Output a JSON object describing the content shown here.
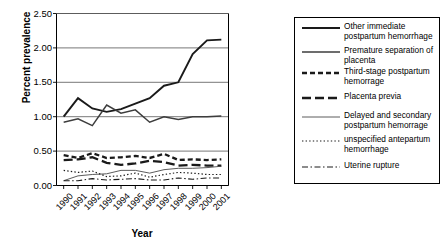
{
  "chart_data": {
    "type": "line",
    "title": "",
    "xlabel": "Year",
    "ylabel": "Percent prevalence",
    "ylim": [
      0.0,
      2.5
    ],
    "yticks": [
      "0.00",
      "0.50",
      "1.00",
      "1.50",
      "2.00",
      "2.50"
    ],
    "grid": true,
    "legend_position": "right",
    "categories": [
      "1990",
      "1991",
      "1992",
      "1993",
      "1994",
      "1995",
      "1996",
      "1997",
      "1998",
      "1999",
      "2000",
      "2001"
    ],
    "series": [
      {
        "name": "Other immediate postpartum hemorrhage",
        "style": "solid-thick",
        "color": "#1a1a1a",
        "values": [
          1.0,
          1.27,
          1.12,
          1.07,
          1.11,
          1.19,
          1.27,
          1.45,
          1.5,
          1.91,
          2.11,
          2.12
        ]
      },
      {
        "name": "Premature separation of placenta",
        "style": "solid-medium",
        "color": "#3d3d3d",
        "values": [
          0.92,
          0.97,
          0.87,
          1.17,
          1.05,
          1.1,
          0.92,
          1.0,
          0.96,
          1.0,
          1.0,
          1.01
        ]
      },
      {
        "name": "Third-stage postpartum hemorrage",
        "style": "dashed-square",
        "color": "#1a1a1a",
        "values": [
          0.44,
          0.4,
          0.47,
          0.4,
          0.41,
          0.43,
          0.4,
          0.46,
          0.37,
          0.38,
          0.37,
          0.38
        ]
      },
      {
        "name": "Placenta previa",
        "style": "dashed-long",
        "color": "#1a1a1a",
        "values": [
          0.37,
          0.38,
          0.41,
          0.33,
          0.3,
          0.32,
          0.36,
          0.34,
          0.29,
          0.3,
          0.29,
          0.29
        ]
      },
      {
        "name": "Delayed and secondary postpartum hemorrage",
        "style": "solid-thin",
        "color": "#4a4a4a",
        "values": [
          0.07,
          0.14,
          0.16,
          0.17,
          0.22,
          0.22,
          0.18,
          0.23,
          0.25,
          0.25,
          0.26,
          0.28
        ]
      },
      {
        "name": "unspecified antepartum hemorrhage",
        "style": "dotted",
        "color": "#1a1a1a",
        "values": [
          0.22,
          0.19,
          0.21,
          0.13,
          0.14,
          0.18,
          0.12,
          0.16,
          0.19,
          0.18,
          0.16,
          0.16
        ]
      },
      {
        "name": "Uterine rupture",
        "style": "dash-dot",
        "color": "#1a1a1a",
        "values": [
          0.07,
          0.07,
          0.1,
          0.08,
          0.09,
          0.1,
          0.08,
          0.08,
          0.11,
          0.09,
          0.11,
          0.11
        ]
      }
    ]
  },
  "legend": {
    "entries": [
      {
        "label": "Other immediate postpartum hemorrhage"
      },
      {
        "label": "Premature separation of placenta"
      },
      {
        "label": "Third-stage postpartum hemorrage"
      },
      {
        "label": "Placenta previa"
      },
      {
        "label": "Delayed and secondary postpartum hemorrage"
      },
      {
        "label": "unspecified antepartum hemorrhage"
      },
      {
        "label": "Uterine rupture"
      }
    ]
  },
  "axes": {
    "y_title": "Percent prevalence",
    "x_title": "Year"
  }
}
